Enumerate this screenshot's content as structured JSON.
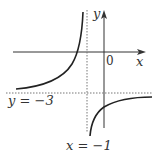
{
  "diagram": {
    "type": "function-graph",
    "axes": {
      "x_label": "x",
      "y_label": "y",
      "origin_label": "0"
    },
    "asymptotes": {
      "vertical_label": "x = −1",
      "horizontal_label": "y = −3"
    },
    "colors": {
      "curve": "#222222",
      "axis": "#333333",
      "asymptote": "#777777",
      "text": "#333333"
    }
  }
}
